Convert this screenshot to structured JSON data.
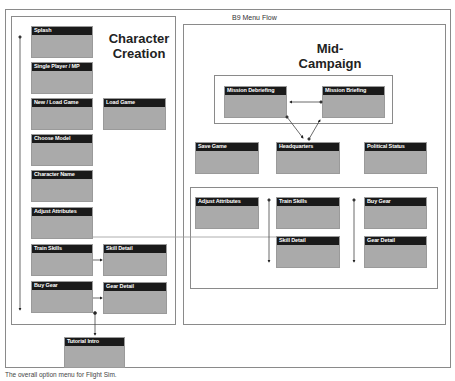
{
  "document": {
    "title": "B9 Menu Flow",
    "caption": "The overall option menu for Flight Sim."
  },
  "sections": {
    "character_creation": {
      "title_line1": "Character",
      "title_line2": "Creation"
    },
    "mid_campaign": {
      "title_line1": "Mid-",
      "title_line2": "Campaign"
    }
  },
  "nodes": {
    "splash": "Splash",
    "single_player_mp": "Single Player / MP",
    "new_load_game": "New / Load Game",
    "load_game": "Load Game",
    "choose_model": "Choose Model",
    "character_name": "Character Name",
    "adjust_attributes_cc": "Adjust Attributes",
    "train_skills_cc": "Train Skills",
    "skill_detail_cc": "Skill Detail",
    "buy_gear_cc": "Buy Gear",
    "gear_detail_cc": "Gear Detail",
    "tutorial_intro": "Tutorial Intro",
    "mission_debriefing": "Mission Debriefing",
    "mission_briefing": "Mission Briefing",
    "save_game": "Save Game",
    "headquarters": "Headquarters",
    "political_status": "Political Status",
    "adjust_attributes_mc": "Adjust Attributes",
    "train_skills_mc": "Train Skills",
    "buy_gear_mc": "Buy Gear",
    "skill_detail_mc": "Skill Detail",
    "gear_detail_mc": "Gear Detail"
  },
  "colors": {
    "node_body": "#aaaaaa",
    "node_header": "#1a1a1a",
    "frame_border": "#8a8a8a"
  }
}
